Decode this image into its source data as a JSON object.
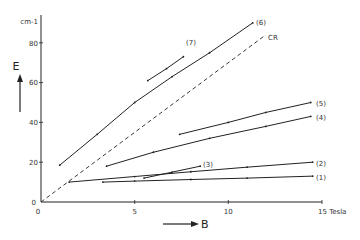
{
  "chart_data": {
    "type": "line",
    "title": "",
    "xlabel": "B",
    "ylabel": "E",
    "x_unit": "Tesla",
    "y_unit": "cm-1",
    "xlim": [
      0,
      15
    ],
    "ylim": [
      0,
      95
    ],
    "x_ticks": [
      0,
      5,
      10,
      15
    ],
    "y_ticks": [
      0,
      20,
      40,
      60,
      80
    ],
    "grid": false,
    "legend": "inline labels at line ends",
    "series": [
      {
        "name": "(1)",
        "style": "solid",
        "points": [
          [
            3.3,
            10
          ],
          [
            5,
            10.5
          ],
          [
            8,
            11.3
          ],
          [
            11,
            12
          ],
          [
            14.5,
            13
          ]
        ]
      },
      {
        "name": "(2)",
        "style": "solid",
        "points": [
          [
            1.5,
            10
          ],
          [
            5,
            12.8
          ],
          [
            8,
            15.2
          ],
          [
            11,
            17.5
          ],
          [
            14.5,
            20
          ]
        ]
      },
      {
        "name": "(3)",
        "style": "solid",
        "points": [
          [
            5.5,
            12
          ],
          [
            7,
            15
          ],
          [
            8.5,
            18
          ]
        ]
      },
      {
        "name": "(4)",
        "style": "solid",
        "points": [
          [
            3.5,
            18
          ],
          [
            6,
            25
          ],
          [
            9,
            32
          ],
          [
            12,
            38
          ],
          [
            14.4,
            43
          ]
        ]
      },
      {
        "name": "(5)",
        "style": "solid",
        "points": [
          [
            7.4,
            34
          ],
          [
            10,
            40
          ],
          [
            12,
            45
          ],
          [
            14.4,
            50
          ]
        ]
      },
      {
        "name": "(6)",
        "style": "solid",
        "points": [
          [
            1,
            18.5
          ],
          [
            3,
            34
          ],
          [
            5,
            50
          ],
          [
            7,
            63
          ],
          [
            9,
            75
          ],
          [
            11.3,
            90
          ]
        ]
      },
      {
        "name": "(7)",
        "style": "solid",
        "points": [
          [
            5.7,
            61
          ],
          [
            6.7,
            67
          ],
          [
            7.6,
            73
          ]
        ]
      },
      {
        "name": "CR",
        "style": "dashed",
        "points": [
          [
            0,
            0
          ],
          [
            3,
            21
          ],
          [
            6,
            42
          ],
          [
            9,
            63
          ],
          [
            12,
            84
          ]
        ]
      }
    ]
  },
  "axes": {
    "x_tick_labels": [
      "0",
      "5",
      "10",
      "15 Tesla"
    ],
    "y_tick_labels": [
      "0",
      "20",
      "40",
      "60",
      "80"
    ],
    "y_unit_label": "cm-1",
    "x_label": "B",
    "y_label": "E"
  },
  "labels": {
    "s1": "(1)",
    "s2": "(2)",
    "s3": "(3)",
    "s4": "(4)",
    "s5": "(5)",
    "s6": "(6)",
    "s7": "(7)",
    "cr": "CR"
  }
}
